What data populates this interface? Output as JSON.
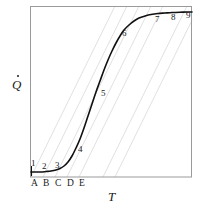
{
  "figure": {
    "type": "line-plot-with-construction-lines",
    "background_color": "#ffffff",
    "frame": {
      "color": "#9a9a9a",
      "x0": 30,
      "y0": 6,
      "x1": 192,
      "y1": 177
    },
    "axes": {
      "x_title": "T",
      "y_title": "Q",
      "y_title_has_overdot": true,
      "x_title_pos": {
        "x": 108,
        "y": 190
      },
      "y_title_pos": {
        "x": 12,
        "y": 74
      }
    },
    "tick_labels": [
      {
        "text": "A",
        "x": 31,
        "y": 179
      },
      {
        "text": "B",
        "x": 43,
        "y": 179
      },
      {
        "text": "C",
        "x": 55,
        "y": 179
      },
      {
        "text": "D",
        "x": 67,
        "y": 179
      },
      {
        "text": "E",
        "x": 79,
        "y": 179
      }
    ],
    "curve_labels": [
      {
        "text": "1",
        "x": 31,
        "y": 159
      },
      {
        "text": "2",
        "x": 42,
        "y": 162
      },
      {
        "text": "3",
        "x": 55,
        "y": 161
      },
      {
        "text": "4",
        "x": 78,
        "y": 145
      },
      {
        "text": "5",
        "x": 101,
        "y": 89
      },
      {
        "text": "6",
        "x": 122,
        "y": 29
      },
      {
        "text": "7",
        "x": 155,
        "y": 15
      },
      {
        "text": "8",
        "x": 171,
        "y": 13
      },
      {
        "text": "9",
        "x": 186,
        "y": 11
      }
    ],
    "curve": {
      "color": "#111111",
      "width": 1.6,
      "description": "sigmoid S-shaped heat-release rate curve",
      "points": [
        [
          31,
          172
        ],
        [
          36,
          172
        ],
        [
          41,
          172
        ],
        [
          46,
          171.5
        ],
        [
          51,
          171
        ],
        [
          56,
          170
        ],
        [
          60,
          168.5
        ],
        [
          64,
          166
        ],
        [
          68,
          162
        ],
        [
          72,
          156
        ],
        [
          76,
          148
        ],
        [
          80,
          139
        ],
        [
          84,
          128
        ],
        [
          88,
          116
        ],
        [
          92,
          104
        ],
        [
          96,
          92
        ],
        [
          100,
          81
        ],
        [
          104,
          70
        ],
        [
          108,
          60
        ],
        [
          112,
          51
        ],
        [
          116,
          43
        ],
        [
          120,
          36
        ],
        [
          124,
          30
        ],
        [
          129,
          25
        ],
        [
          134,
          21
        ],
        [
          139,
          18
        ],
        [
          145,
          16
        ],
        [
          151,
          14.5
        ],
        [
          158,
          13.5
        ],
        [
          165,
          13
        ],
        [
          172,
          12.5
        ],
        [
          180,
          12.2
        ],
        [
          188,
          12
        ],
        [
          192,
          12
        ]
      ]
    },
    "construction_lines": {
      "color": "#dcdcdc",
      "width": 0.9,
      "count": 5,
      "description": "five parallel light-gray tangent construction lines rising from tick points A-E",
      "lines": [
        {
          "x_start": 31,
          "y_start": 177,
          "x_end": 115,
          "y_end": 6
        },
        {
          "x_start": 43,
          "y_start": 177,
          "x_end": 127,
          "y_end": 6
        },
        {
          "x_start": 55,
          "y_start": 177,
          "x_end": 139,
          "y_end": 6
        },
        {
          "x_start": 67,
          "y_start": 177,
          "x_end": 151,
          "y_end": 6
        },
        {
          "x_start": 79,
          "y_start": 177,
          "x_end": 163,
          "y_end": 6
        }
      ],
      "extra_lines": [
        {
          "x_start": 103,
          "y_start": 177,
          "x_end": 187,
          "y_end": 6
        },
        {
          "x_start": 115,
          "y_start": 177,
          "x_end": 199,
          "y_end": 6
        }
      ]
    }
  },
  "chart_data": {
    "type": "line",
    "title": "",
    "xlabel": "T",
    "ylabel": "Q",
    "grid": false,
    "legend": null,
    "annotations": [
      "1",
      "2",
      "3",
      "4",
      "5",
      "6",
      "7",
      "8",
      "9"
    ],
    "xticklabels": [
      "A",
      "B",
      "C",
      "D",
      "E"
    ],
    "yticklabels": [],
    "series": [
      {
        "name": "heat release rate",
        "x": [
          0.0,
          0.05,
          0.1,
          0.15,
          0.2,
          0.25,
          0.3,
          0.35,
          0.4,
          0.45,
          0.5,
          0.55,
          0.6,
          0.65,
          0.7,
          0.75,
          0.8,
          0.85,
          0.9,
          0.95,
          1.0
        ],
        "y": [
          0.03,
          0.03,
          0.035,
          0.04,
          0.055,
          0.08,
          0.13,
          0.21,
          0.32,
          0.45,
          0.58,
          0.7,
          0.8,
          0.87,
          0.92,
          0.945,
          0.96,
          0.97,
          0.975,
          0.98,
          0.98
        ]
      }
    ],
    "xlim": [
      0,
      1
    ],
    "ylim": [
      0,
      1
    ]
  }
}
